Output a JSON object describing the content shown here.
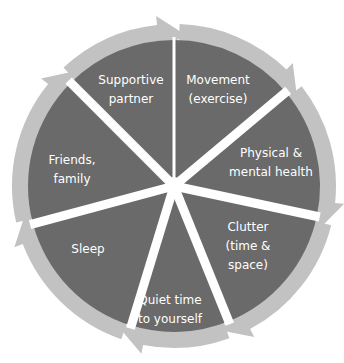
{
  "diagram": {
    "type": "cycle",
    "direction": "clockwise",
    "center": [
      174,
      186
    ],
    "ring_outer_radius": 162,
    "ring_inner_radius": 146,
    "segment_radius": 146,
    "colors": {
      "segment_fill": "#6a6a6a",
      "ring_fill": "#c2c2c2",
      "separator": "#ffffff",
      "label_text": "#ffffff",
      "background": "#ffffff"
    },
    "segments": [
      {
        "id": "movement",
        "lines": [
          "Movement",
          "(exercise)"
        ],
        "start_angle": 90,
        "end_angle": 40,
        "label_pos": [
          218,
          90
        ]
      },
      {
        "id": "physical-mental-health",
        "lines": [
          "Physical &",
          "mental health"
        ],
        "start_angle": 40,
        "end_angle": -12,
        "label_pos": [
          271,
          163
        ]
      },
      {
        "id": "clutter",
        "lines": [
          "Clutter",
          "(time &",
          "space)"
        ],
        "start_angle": -12,
        "end_angle": -68,
        "label_pos": [
          248,
          246
        ]
      },
      {
        "id": "quiet-time",
        "lines": [
          "Quiet time",
          "to yourself"
        ],
        "start_angle": -68,
        "end_angle": -107,
        "label_pos": [
          170,
          310
        ]
      },
      {
        "id": "sleep",
        "lines": [
          "Sleep"
        ],
        "start_angle": -107,
        "end_angle": -165,
        "label_pos": [
          88,
          249
        ]
      },
      {
        "id": "friends-family",
        "lines": [
          "Friends,",
          "family"
        ],
        "start_angle": 195,
        "end_angle": 135,
        "label_pos": [
          72,
          170
        ]
      },
      {
        "id": "supportive-partner",
        "lines": [
          "Supportive",
          "partner"
        ],
        "start_angle": 135,
        "end_angle": 90,
        "label_pos": [
          131,
          90
        ]
      }
    ]
  }
}
